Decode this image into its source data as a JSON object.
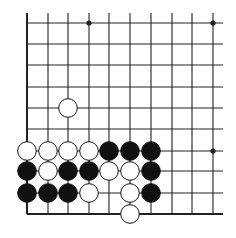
{
  "diagram": {
    "type": "go-board-partial",
    "columns_x": [
      27,
      48,
      68,
      89,
      109,
      130,
      151,
      172,
      192,
      213
    ],
    "rows_y": [
      23,
      44,
      65,
      87,
      108,
      129,
      151,
      171,
      193,
      214
    ],
    "line_top": 13,
    "line_right": 223,
    "edges": {
      "left": true,
      "bottom": true
    },
    "star_points": [
      [
        3,
        0
      ],
      [
        9,
        0
      ],
      [
        9,
        6
      ]
    ],
    "stone_radius": 9.3,
    "stones": [
      {
        "c": 2,
        "r": 4,
        "color": "white"
      },
      {
        "c": 0,
        "r": 6,
        "color": "white"
      },
      {
        "c": 1,
        "r": 6,
        "color": "white"
      },
      {
        "c": 2,
        "r": 6,
        "color": "white"
      },
      {
        "c": 3,
        "r": 6,
        "color": "white"
      },
      {
        "c": 4,
        "r": 6,
        "color": "black"
      },
      {
        "c": 5,
        "r": 6,
        "color": "black"
      },
      {
        "c": 6,
        "r": 6,
        "color": "black"
      },
      {
        "c": 0,
        "r": 7,
        "color": "black"
      },
      {
        "c": 1,
        "r": 7,
        "color": "white"
      },
      {
        "c": 2,
        "r": 7,
        "color": "black"
      },
      {
        "c": 3,
        "r": 7,
        "color": "black"
      },
      {
        "c": 4,
        "r": 7,
        "color": "white"
      },
      {
        "c": 5,
        "r": 7,
        "color": "white"
      },
      {
        "c": 6,
        "r": 7,
        "color": "black"
      },
      {
        "c": 0,
        "r": 8,
        "color": "black"
      },
      {
        "c": 1,
        "r": 8,
        "color": "black"
      },
      {
        "c": 2,
        "r": 8,
        "color": "black"
      },
      {
        "c": 3,
        "r": 8,
        "color": "white"
      },
      {
        "c": 5,
        "r": 8,
        "color": "white"
      },
      {
        "c": 6,
        "r": 8,
        "color": "black"
      },
      {
        "c": 5,
        "r": 9,
        "color": "white"
      }
    ],
    "colors": {
      "line": "#222222",
      "black_stone": "#111111",
      "white_stone": "#ffffff",
      "background": "#ffffff"
    }
  }
}
